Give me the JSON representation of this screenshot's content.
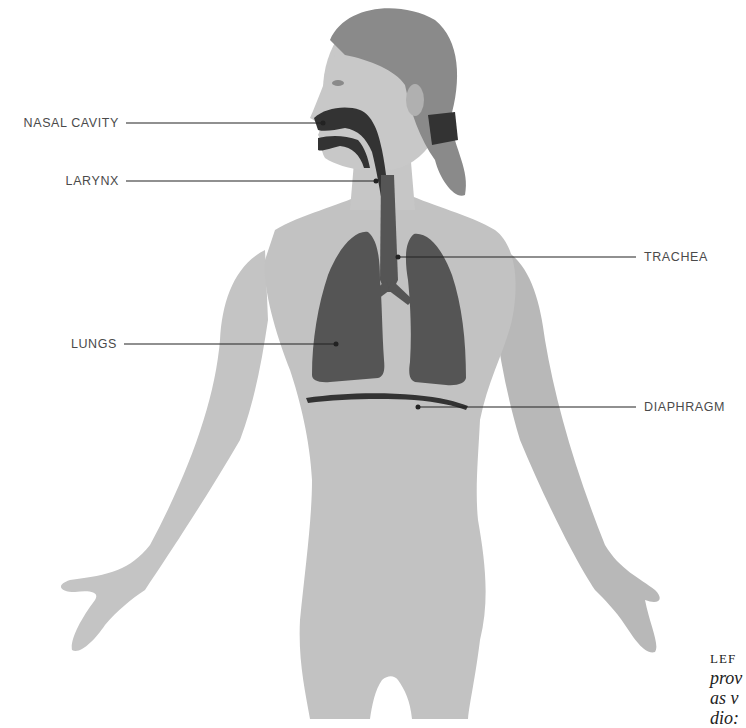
{
  "figure": {
    "colors": {
      "skin": "#bdbdbd",
      "skin_dark": "#a9a9a9",
      "hair": "#8c8c8c",
      "organ": "#555555",
      "airway": "#333333",
      "leader_line": "#222222",
      "label_text": "#4a4a4a"
    }
  },
  "labels": {
    "nasal_cavity": "NASAL CAVITY",
    "larynx": "LARYNX",
    "trachea": "TRACHEA",
    "lungs": "LUNGS",
    "diaphragm": "DIAPHRAGM"
  },
  "caption": {
    "heading": "LEF",
    "lines": [
      "prov",
      "as v",
      "dio:"
    ]
  }
}
